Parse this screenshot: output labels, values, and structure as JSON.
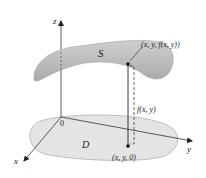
{
  "figure": {
    "surface_label": "S",
    "region_label": "D",
    "origin_label": "0",
    "axes": {
      "x_label": "x",
      "y_label": "y",
      "z_label": "z"
    },
    "point_on_surface_label": "(x, y, f(x, y))",
    "point_in_region_label": "(x, y, 0)",
    "height_label": "f(x, y)"
  },
  "colors": {
    "surface_fill": "#b9b9b9",
    "surface_highlight": "#d6d6d6",
    "region_fill": "#e3e3e3",
    "region_stroke": "#a8a8a8",
    "axis": "#333333",
    "text": "#1a1a1a"
  }
}
